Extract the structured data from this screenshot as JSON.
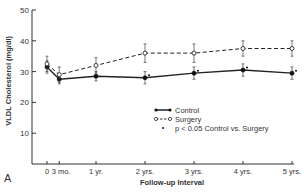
{
  "chart_data": {
    "type": "line",
    "panel_label": "A",
    "title": "",
    "xlabel": "Follow-up Interval",
    "ylabel": "VLDL Cholesterol (mg/dl)",
    "ylim": [
      0,
      50
    ],
    "yticks": [
      10,
      20,
      30,
      40,
      50
    ],
    "categories": [
      "0",
      "3 mo.",
      "1 yr.",
      "2 yrs.",
      "3 yrs.",
      "4 yrs.",
      "5 yrs."
    ],
    "x_months": [
      0,
      3,
      12,
      24,
      36,
      48,
      60
    ],
    "series": [
      {
        "name": "Control",
        "style": "solid, filled circles",
        "values": [
          31.5,
          27.5,
          28.5,
          28,
          29.5,
          30.5,
          29.5
        ],
        "errors": [
          2,
          1.5,
          1.5,
          2,
          2,
          2,
          2
        ]
      },
      {
        "name": "Surgery",
        "style": "dashed, open circles",
        "values": [
          32.5,
          29,
          32,
          36,
          36,
          37.5,
          37.5
        ],
        "errors": [
          2.5,
          2.5,
          2.5,
          3,
          3,
          2.5,
          2.5
        ]
      }
    ],
    "significance_marker": "•",
    "significant_points": [
      "2 yrs.",
      "3 yrs.",
      "4 yrs.",
      "5 yrs."
    ],
    "legend": [
      {
        "label": "Control"
      },
      {
        "label": "Surgery"
      },
      {
        "label": "p < 0.05 Control vs. Surgery"
      }
    ],
    "legend_position": "lower right inside plot",
    "grid": false
  }
}
